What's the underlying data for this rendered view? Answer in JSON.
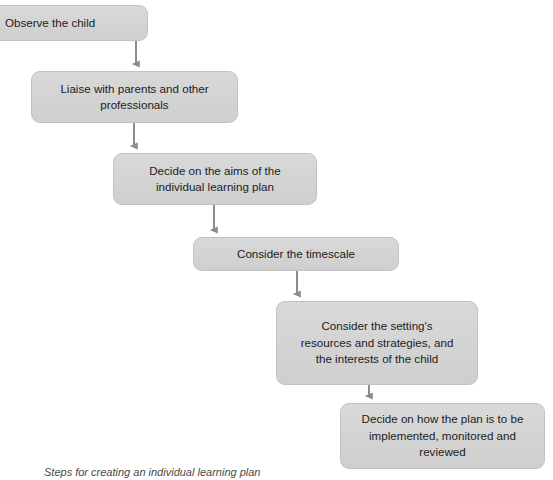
{
  "figure": {
    "caption": "Steps for creating an individual learning plan",
    "colors": {
      "node_fill": "#d4d4d4",
      "node_border": "#c2c2c2",
      "text": "#1c1c1c",
      "arrow": "#8c8c8c",
      "background": "#ffffff",
      "caption_text": "#4a4a4a"
    }
  },
  "flowchart": {
    "type": "flowchart",
    "orientation": "descending-staircase",
    "nodes": [
      {
        "id": "step-1",
        "label": "Observe the child"
      },
      {
        "id": "step-2",
        "label": "Liaise with parents and other\nprofessionals"
      },
      {
        "id": "step-3",
        "label": "Decide on the aims of the\nindividual learning plan"
      },
      {
        "id": "step-4",
        "label": "Consider the timescale"
      },
      {
        "id": "step-5",
        "label": "Consider the setting's\nresources and strategies, and\nthe interests of the child"
      },
      {
        "id": "step-6",
        "label": "Decide on how the plan is to be\nimplemented, monitored and\nreviewed"
      }
    ],
    "connectors": [
      {
        "from": "step-1",
        "to": "step-2",
        "style": "arrow-down"
      },
      {
        "from": "step-2",
        "to": "step-3",
        "style": "arrow-down"
      },
      {
        "from": "step-3",
        "to": "step-4",
        "style": "arrow-down"
      },
      {
        "from": "step-4",
        "to": "step-5",
        "style": "arrow-down"
      },
      {
        "from": "step-5",
        "to": "step-6",
        "style": "arrow-down"
      }
    ]
  }
}
